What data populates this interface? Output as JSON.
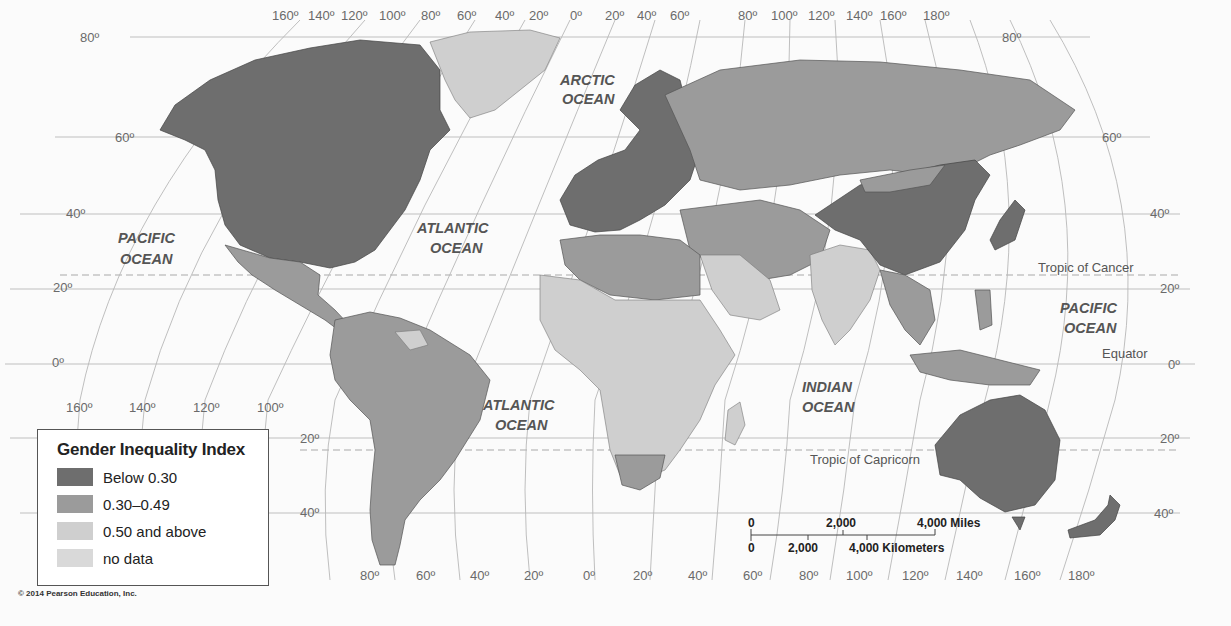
{
  "map": {
    "title": "Gender Inequality Index",
    "colors": {
      "below_030": "#6e6e6e",
      "range_030_049": "#9b9b9b",
      "above_050": "#cfcfcf",
      "no_data": "#d9d9d9"
    },
    "top_longitudes": [
      "160º",
      "140º",
      "120º",
      "100º",
      "80º",
      "60º",
      "40º",
      "20º",
      "0º",
      "20º",
      "40º",
      "60º",
      "80º",
      "100º",
      "120º",
      "140º",
      "160º",
      "180º"
    ],
    "bottom_longitudes_left": [
      "160º",
      "140º",
      "120º",
      "100º"
    ],
    "bottom_longitudes": [
      "80º",
      "60º",
      "40º",
      "20º",
      "0º",
      "20º",
      "40º",
      "60º",
      "80º",
      "100º",
      "120º",
      "140º",
      "160º",
      "180º"
    ],
    "left_latitudes": [
      "80º",
      "60º",
      "40º",
      "20º",
      "0º",
      "20º",
      "40º"
    ],
    "right_latitudes": [
      "80º",
      "60º",
      "40º",
      "20º",
      "0º",
      "20º",
      "40º"
    ],
    "oceans": {
      "arctic": [
        "ARCTIC",
        "OCEAN"
      ],
      "pacific_west": [
        "PACIFIC",
        "OCEAN"
      ],
      "atlantic_north": [
        "ATLANTIC",
        "OCEAN"
      ],
      "atlantic_south": [
        "ATLANTIC",
        "OCEAN"
      ],
      "indian": [
        "INDIAN",
        "OCEAN"
      ],
      "pacific_east": [
        "PACIFIC",
        "OCEAN"
      ]
    },
    "lines": {
      "tropic_cancer": "Tropic of Cancer",
      "equator": "Equator",
      "tropic_capricorn": "Tropic of Capricorn"
    },
    "scale": {
      "miles_0": "0",
      "miles_2000": "2,000",
      "miles_4000": "4,000 Miles",
      "km_0": "0",
      "km_2000": "2,000",
      "km_4000": "4,000 Kilometers"
    }
  },
  "legend": {
    "title": "Gender Inequality Index",
    "items": [
      {
        "label": "Below 0.30",
        "color": "#6e6e6e"
      },
      {
        "label": "0.30–0.49",
        "color": "#9b9b9b"
      },
      {
        "label": "0.50 and above",
        "color": "#cfcfcf"
      },
      {
        "label": "no data",
        "color": "#d9d9d9"
      }
    ]
  },
  "copyright": "© 2014 Pearson Education, Inc."
}
